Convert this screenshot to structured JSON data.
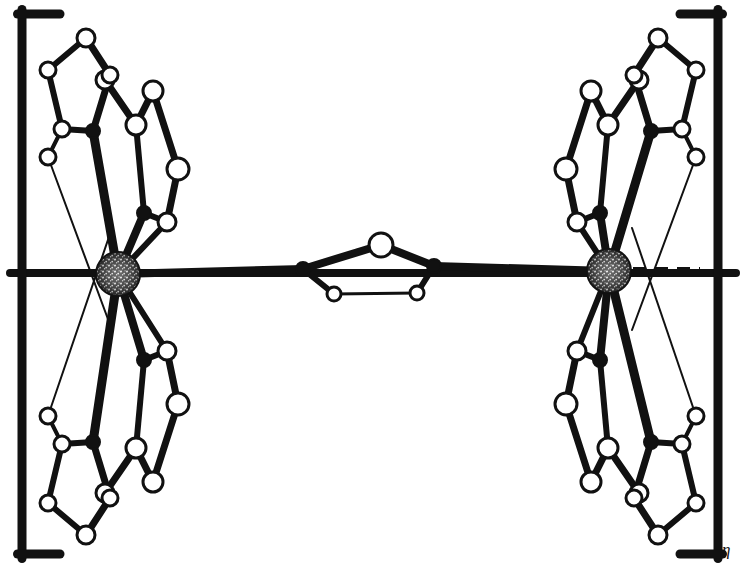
{
  "figure": {
    "kind": "ball-and-stick-crystal-structure",
    "caption_subscript": "η",
    "background_color": "#ffffff",
    "ink_color": "#111111",
    "atom_fill_open": "#ffffff",
    "atom_fill_filled": "#111111",
    "metal_fill": "#2b2b2b",
    "metal_speckle": "#f2f2f2"
  },
  "brackets": {
    "left": {
      "name": "left-square-bracket",
      "x": 22,
      "y_top": 14,
      "y_bottom": 554,
      "arm": 38,
      "stroke": 9
    },
    "right": {
      "name": "right-square-bracket",
      "x": 718,
      "y_top": 14,
      "y_bottom": 554,
      "arm": 38,
      "stroke": 9
    },
    "subscript": {
      "text": "η",
      "x": 722,
      "y": 541
    }
  },
  "axis_line": {
    "name": "horizontal-axis-bond",
    "y": 273,
    "x_start": 10,
    "x_end": 736,
    "stroke": 8
  },
  "metal_centres": [
    {
      "id": "M1",
      "label": "metal-centre-left",
      "cx": 118,
      "cy": 274,
      "r": 22
    },
    {
      "id": "M2",
      "label": "metal-centre-right",
      "cx": 609,
      "cy": 271,
      "r": 22
    }
  ],
  "dashed_bonds": [
    {
      "name": "dashed-bond-left",
      "x1": 142,
      "y1": 273,
      "x2": 205,
      "y2": 273,
      "stroke": 8,
      "dash": "13 9"
    },
    {
      "name": "dashed-bond-right",
      "x1": 633,
      "y1": 271,
      "x2": 700,
      "y2": 271,
      "stroke": 8,
      "dash": "13 9"
    }
  ],
  "bridge": {
    "name": "central-bridging-unit",
    "atoms": [
      {
        "id": "B1",
        "type": "filled",
        "cx": 303,
        "cy": 269,
        "r": 7,
        "label": "bridge-anchor-left"
      },
      {
        "id": "B2",
        "type": "filled",
        "cx": 434,
        "cy": 266,
        "r": 7,
        "label": "bridge-anchor-right"
      },
      {
        "id": "B3",
        "type": "open",
        "cx": 381,
        "cy": 245,
        "r": 12,
        "label": "bridge-apex-atom"
      },
      {
        "id": "B4",
        "type": "open",
        "cx": 334,
        "cy": 294,
        "r": 7,
        "label": "bridge-lower-left-atom"
      },
      {
        "id": "B5",
        "type": "open",
        "cx": 417,
        "cy": 293,
        "r": 7,
        "label": "bridge-lower-right-atom"
      }
    ],
    "bonds": [
      {
        "a": "B1",
        "b": "B3",
        "w": 8
      },
      {
        "a": "B3",
        "b": "B2",
        "w": 8
      },
      {
        "a": "B1",
        "b": "B4",
        "w": 6
      },
      {
        "a": "B2",
        "b": "B5",
        "w": 6
      },
      {
        "a": "B4",
        "b": "B5",
        "w": 3
      }
    ]
  },
  "ligand_left_upper": {
    "name": "ligand-left-upper",
    "atoms": [
      {
        "id": "a1",
        "type": "open",
        "cx": 86,
        "cy": 38,
        "r": 9
      },
      {
        "id": "a2",
        "type": "open",
        "cx": 48,
        "cy": 70,
        "r": 8
      },
      {
        "id": "a3",
        "type": "open",
        "cx": 62,
        "cy": 129,
        "r": 8
      },
      {
        "id": "a4",
        "type": "filled",
        "cx": 93,
        "cy": 131,
        "r": 7
      },
      {
        "id": "a5",
        "type": "open",
        "cx": 105,
        "cy": 80,
        "r": 9
      },
      {
        "id": "a6",
        "type": "open",
        "cx": 110,
        "cy": 75,
        "r": 8
      },
      {
        "id": "a7",
        "type": "open",
        "cx": 136,
        "cy": 125,
        "r": 10
      },
      {
        "id": "a8",
        "type": "open",
        "cx": 153,
        "cy": 91,
        "r": 10
      },
      {
        "id": "a9",
        "type": "open",
        "cx": 178,
        "cy": 169,
        "r": 11
      },
      {
        "id": "a10",
        "type": "open",
        "cx": 48,
        "cy": 157,
        "r": 8
      },
      {
        "id": "a11",
        "type": "filled",
        "cx": 144,
        "cy": 213,
        "r": 7
      },
      {
        "id": "a12",
        "type": "open",
        "cx": 167,
        "cy": 222,
        "r": 9
      }
    ],
    "bonds": [
      {
        "a": "a1",
        "b": "a2",
        "w": 6
      },
      {
        "a": "a2",
        "b": "a3",
        "w": 6
      },
      {
        "a": "a3",
        "b": "a4",
        "w": 6
      },
      {
        "a": "a4",
        "b": "a6",
        "w": 7
      },
      {
        "a": "a6",
        "b": "a1",
        "w": 7
      },
      {
        "a": "a5",
        "b": "a7",
        "w": 7
      },
      {
        "a": "a7",
        "b": "a8",
        "w": 7
      },
      {
        "a": "a8",
        "b": "a9",
        "w": 7
      },
      {
        "a": "a3",
        "b": "a10",
        "w": 4
      },
      {
        "a": "a7",
        "b": "a11",
        "w": 6
      },
      {
        "a": "a11",
        "b": "a12",
        "w": 6
      },
      {
        "a": "a9",
        "b": "a12",
        "w": 7
      }
    ],
    "metal_bonds": [
      {
        "from": "a4",
        "w": 9
      },
      {
        "from": "a11",
        "w": 8
      },
      {
        "from": "a12",
        "w": 6
      }
    ],
    "thin_lines": [
      {
        "from": "a10",
        "to_x": 112,
        "to_y": 330,
        "w": 2
      }
    ]
  },
  "ligand_left_lower": {
    "name": "ligand-left-lower",
    "atoms": [
      {
        "id": "b1",
        "type": "open",
        "cx": 86,
        "cy": 535,
        "r": 9
      },
      {
        "id": "b2",
        "type": "open",
        "cx": 48,
        "cy": 503,
        "r": 8
      },
      {
        "id": "b3",
        "type": "open",
        "cx": 62,
        "cy": 444,
        "r": 8
      },
      {
        "id": "b4",
        "type": "filled",
        "cx": 93,
        "cy": 442,
        "r": 7
      },
      {
        "id": "b5",
        "type": "open",
        "cx": 105,
        "cy": 493,
        "r": 9
      },
      {
        "id": "b6",
        "type": "open",
        "cx": 110,
        "cy": 498,
        "r": 8
      },
      {
        "id": "b7",
        "type": "open",
        "cx": 136,
        "cy": 448,
        "r": 10
      },
      {
        "id": "b8",
        "type": "open",
        "cx": 153,
        "cy": 482,
        "r": 10
      },
      {
        "id": "b9",
        "type": "open",
        "cx": 178,
        "cy": 404,
        "r": 11
      },
      {
        "id": "b10",
        "type": "open",
        "cx": 48,
        "cy": 416,
        "r": 8
      },
      {
        "id": "b11",
        "type": "filled",
        "cx": 144,
        "cy": 360,
        "r": 7
      },
      {
        "id": "b12",
        "type": "open",
        "cx": 167,
        "cy": 351,
        "r": 9
      }
    ],
    "bonds": [
      {
        "a": "b1",
        "b": "b2",
        "w": 6
      },
      {
        "a": "b2",
        "b": "b3",
        "w": 6
      },
      {
        "a": "b3",
        "b": "b4",
        "w": 6
      },
      {
        "a": "b4",
        "b": "b6",
        "w": 7
      },
      {
        "a": "b6",
        "b": "b1",
        "w": 7
      },
      {
        "a": "b5",
        "b": "b7",
        "w": 7
      },
      {
        "a": "b7",
        "b": "b8",
        "w": 7
      },
      {
        "a": "b8",
        "b": "b9",
        "w": 7
      },
      {
        "a": "b3",
        "b": "b10",
        "w": 4
      },
      {
        "a": "b7",
        "b": "b11",
        "w": 6
      },
      {
        "a": "b11",
        "b": "b12",
        "w": 6
      },
      {
        "a": "b9",
        "b": "b12",
        "w": 7
      }
    ],
    "metal_bonds": [
      {
        "from": "b4",
        "w": 9
      },
      {
        "from": "b11",
        "w": 8
      },
      {
        "from": "b12",
        "w": 6
      }
    ],
    "thin_lines": [
      {
        "from": "b10",
        "to_x": 112,
        "to_y": 228,
        "w": 2
      }
    ]
  },
  "ligand_right_upper": {
    "name": "ligand-right-upper",
    "mirror_of": "ligand_left_upper",
    "mirror_axis_x": 372
  },
  "ligand_right_lower": {
    "name": "ligand-right-lower",
    "mirror_of": "ligand_left_lower",
    "mirror_axis_x": 372
  }
}
